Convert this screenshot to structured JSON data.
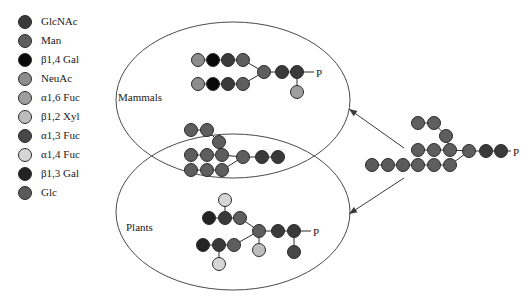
{
  "figure": {
    "phosphate_label": "P",
    "colors": {
      "GlcNAc": "#3a3a3a",
      "Man": "#5e5e5e",
      "b14Gal": "#090909",
      "NeuAc": "#8c8c8c",
      "a16Fuc": "#9e9e9e",
      "b12Xyl": "#bdbdbd",
      "a13Fuc": "#474747",
      "a14Fuc": "#d6d6d6",
      "b13Gal": "#232323",
      "Glc": "#5a5a5a",
      "outline": "#2b2b2b",
      "ellipse": "#4a4a4a",
      "arrow": "#3a3a3a",
      "text": "#1a1a1a"
    }
  },
  "legend": {
    "items": [
      {
        "key": "GlcNAc",
        "label": "GlcNAc",
        "color": "#3a3a3a"
      },
      {
        "key": "Man",
        "label": "Man",
        "color": "#5e5e5e"
      },
      {
        "key": "b14Gal",
        "label": "β1,4 Gal",
        "color": "#090909"
      },
      {
        "key": "NeuAc",
        "label": "NeuAc",
        "color": "#8c8c8c"
      },
      {
        "key": "a16Fuc",
        "label": "α1,6 Fuc",
        "color": "#9e9e9e"
      },
      {
        "key": "b12Xyl",
        "label": "β1,2 Xyl",
        "color": "#bdbdbd"
      },
      {
        "key": "a13Fuc",
        "label": "α1,3 Fuc",
        "color": "#474747"
      },
      {
        "key": "a14Fuc",
        "label": "α1,4 Fuc",
        "color": "#d6d6d6"
      },
      {
        "key": "b13Gal",
        "label": "β1,3 Gal",
        "color": "#232323"
      },
      {
        "key": "Glc",
        "label": "Glc",
        "color": "#5a5a5a"
      }
    ]
  },
  "groups": {
    "mammals": {
      "label": "Mammals",
      "x": 118,
      "y": 92
    },
    "plants": {
      "label": "Plants",
      "x": 126,
      "y": 222
    }
  },
  "ellipses": [
    {
      "name": "mammals-ellipse",
      "cx": 233,
      "cy": 100,
      "rx": 117,
      "ry": 78
    },
    {
      "name": "plants-ellipse",
      "cx": 233,
      "cy": 212,
      "rx": 117,
      "ry": 78
    }
  ],
  "arrows": [
    {
      "name": "arrow-to-mammals",
      "x1": 404,
      "y1": 148,
      "x2": 349,
      "y2": 109
    },
    {
      "name": "arrow-to-plants",
      "x1": 404,
      "y1": 178,
      "x2": 349,
      "y2": 214
    }
  ],
  "structures": [
    {
      "name": "mammals-glycan",
      "nodes": [
        {
          "id": "m-a1",
          "sugar": "NeuAc",
          "x": 198,
          "y": 60
        },
        {
          "id": "m-a2",
          "sugar": "b14Gal",
          "x": 213,
          "y": 60
        },
        {
          "id": "m-a3",
          "sugar": "GlcNAc",
          "x": 228,
          "y": 60
        },
        {
          "id": "m-a4",
          "sugar": "Man",
          "x": 243,
          "y": 60
        },
        {
          "id": "m-b1",
          "sugar": "NeuAc",
          "x": 198,
          "y": 84
        },
        {
          "id": "m-b2",
          "sugar": "b14Gal",
          "x": 213,
          "y": 84
        },
        {
          "id": "m-b3",
          "sugar": "GlcNAc",
          "x": 228,
          "y": 84
        },
        {
          "id": "m-b4",
          "sugar": "Man",
          "x": 243,
          "y": 84
        },
        {
          "id": "m-c1",
          "sugar": "Man",
          "x": 264,
          "y": 72
        },
        {
          "id": "m-c2",
          "sugar": "GlcNAc",
          "x": 282,
          "y": 72
        },
        {
          "id": "m-c3",
          "sugar": "GlcNAc",
          "x": 297,
          "y": 72
        },
        {
          "id": "m-f",
          "sugar": "a16Fuc",
          "x": 297,
          "y": 92
        }
      ],
      "links": [
        [
          "m-a1",
          "m-a2"
        ],
        [
          "m-a2",
          "m-a3"
        ],
        [
          "m-a3",
          "m-a4"
        ],
        [
          "m-a4",
          "m-c1"
        ],
        [
          "m-b1",
          "m-b2"
        ],
        [
          "m-b2",
          "m-b3"
        ],
        [
          "m-b3",
          "m-b4"
        ],
        [
          "m-b4",
          "m-c1"
        ],
        [
          "m-c1",
          "m-c2"
        ],
        [
          "m-c2",
          "m-c3"
        ],
        [
          "m-c3",
          "m-f"
        ]
      ],
      "phosphate": {
        "from": "m-c3",
        "x": 316,
        "y": 68
      }
    },
    {
      "name": "shared-high-mannose-glycan",
      "nodes": [
        {
          "id": "s-t1",
          "sugar": "Man",
          "x": 191,
          "y": 130
        },
        {
          "id": "s-t2",
          "sugar": "Man",
          "x": 207,
          "y": 130
        },
        {
          "id": "s-t3",
          "sugar": "Man",
          "x": 219,
          "y": 142
        },
        {
          "id": "s-m1",
          "sugar": "Man",
          "x": 191,
          "y": 155
        },
        {
          "id": "s-m2",
          "sugar": "Man",
          "x": 207,
          "y": 155
        },
        {
          "id": "s-m3",
          "sugar": "Man",
          "x": 222,
          "y": 155
        },
        {
          "id": "s-l1",
          "sugar": "Man",
          "x": 191,
          "y": 170
        },
        {
          "id": "s-l2",
          "sugar": "Man",
          "x": 207,
          "y": 170
        },
        {
          "id": "s-l3",
          "sugar": "Man",
          "x": 222,
          "y": 170
        },
        {
          "id": "s-c1",
          "sugar": "Man",
          "x": 243,
          "y": 157
        },
        {
          "id": "s-c2",
          "sugar": "GlcNAc",
          "x": 262,
          "y": 157
        },
        {
          "id": "s-c3",
          "sugar": "GlcNAc",
          "x": 278,
          "y": 157
        }
      ],
      "links": [
        [
          "s-t1",
          "s-t2"
        ],
        [
          "s-t2",
          "s-t3"
        ],
        [
          "s-t3",
          "s-m3"
        ],
        [
          "s-m1",
          "s-m2"
        ],
        [
          "s-m2",
          "s-m3"
        ],
        [
          "s-l1",
          "s-l2"
        ],
        [
          "s-l2",
          "s-l3"
        ],
        [
          "s-m3",
          "s-c1"
        ],
        [
          "s-l3",
          "s-c1"
        ],
        [
          "s-c1",
          "s-c2"
        ],
        [
          "s-c2",
          "s-c3"
        ]
      ],
      "phosphate": null
    },
    {
      "name": "plants-glycan",
      "nodes": [
        {
          "id": "p-u0",
          "sugar": "a14Fuc",
          "x": 225,
          "y": 200
        },
        {
          "id": "p-u1",
          "sugar": "b13Gal",
          "x": 209,
          "y": 218
        },
        {
          "id": "p-u2",
          "sugar": "GlcNAc",
          "x": 225,
          "y": 218
        },
        {
          "id": "p-u3",
          "sugar": "Man",
          "x": 240,
          "y": 218
        },
        {
          "id": "p-d1",
          "sugar": "b13Gal",
          "x": 203,
          "y": 245
        },
        {
          "id": "p-d2",
          "sugar": "GlcNAc",
          "x": 219,
          "y": 245
        },
        {
          "id": "p-d3",
          "sugar": "Man",
          "x": 234,
          "y": 245
        },
        {
          "id": "p-d0",
          "sugar": "a14Fuc",
          "x": 219,
          "y": 264
        },
        {
          "id": "p-c1",
          "sugar": "Man",
          "x": 259,
          "y": 231
        },
        {
          "id": "p-x",
          "sugar": "b12Xyl",
          "x": 259,
          "y": 250
        },
        {
          "id": "p-c2",
          "sugar": "GlcNAc",
          "x": 278,
          "y": 231
        },
        {
          "id": "p-c3",
          "sugar": "GlcNAc",
          "x": 294,
          "y": 231
        },
        {
          "id": "p-f",
          "sugar": "a13Fuc",
          "x": 294,
          "y": 252
        }
      ],
      "links": [
        [
          "p-u0",
          "p-u2"
        ],
        [
          "p-u1",
          "p-u2"
        ],
        [
          "p-u2",
          "p-u3"
        ],
        [
          "p-u3",
          "p-c1"
        ],
        [
          "p-d1",
          "p-d2"
        ],
        [
          "p-d2",
          "p-d3"
        ],
        [
          "p-d3",
          "p-c1"
        ],
        [
          "p-d0",
          "p-d2"
        ],
        [
          "p-c1",
          "p-x"
        ],
        [
          "p-c1",
          "p-c2"
        ],
        [
          "p-c2",
          "p-c3"
        ],
        [
          "p-c3",
          "p-f"
        ]
      ],
      "phosphate": {
        "from": "p-c3",
        "x": 313,
        "y": 227
      }
    },
    {
      "name": "precursor-glycan",
      "nodes": [
        {
          "id": "r-t1",
          "sugar": "Man",
          "x": 418,
          "y": 123
        },
        {
          "id": "r-t2",
          "sugar": "Man",
          "x": 434,
          "y": 123
        },
        {
          "id": "r-t3",
          "sugar": "Man",
          "x": 446,
          "y": 136
        },
        {
          "id": "r-m1",
          "sugar": "Man",
          "x": 418,
          "y": 150
        },
        {
          "id": "r-m2",
          "sugar": "Man",
          "x": 434,
          "y": 150
        },
        {
          "id": "r-m3",
          "sugar": "Man",
          "x": 450,
          "y": 150
        },
        {
          "id": "r-b1",
          "sugar": "Glc",
          "x": 372,
          "y": 165
        },
        {
          "id": "r-b2",
          "sugar": "Glc",
          "x": 388,
          "y": 165
        },
        {
          "id": "r-b3",
          "sugar": "Glc",
          "x": 403,
          "y": 165
        },
        {
          "id": "r-b4",
          "sugar": "Man",
          "x": 418,
          "y": 165
        },
        {
          "id": "r-b5",
          "sugar": "Man",
          "x": 434,
          "y": 165
        },
        {
          "id": "r-b6",
          "sugar": "Man",
          "x": 450,
          "y": 165
        },
        {
          "id": "r-c1",
          "sugar": "Man",
          "x": 469,
          "y": 151
        },
        {
          "id": "r-c2",
          "sugar": "GlcNAc",
          "x": 486,
          "y": 151
        },
        {
          "id": "r-c3",
          "sugar": "GlcNAc",
          "x": 501,
          "y": 151
        }
      ],
      "links": [
        [
          "r-t1",
          "r-t2"
        ],
        [
          "r-t2",
          "r-t3"
        ],
        [
          "r-t3",
          "r-m3"
        ],
        [
          "r-m1",
          "r-m2"
        ],
        [
          "r-m2",
          "r-m3"
        ],
        [
          "r-b1",
          "r-b2"
        ],
        [
          "r-b2",
          "r-b3"
        ],
        [
          "r-b3",
          "r-b4"
        ],
        [
          "r-b4",
          "r-b5"
        ],
        [
          "r-b5",
          "r-b6"
        ],
        [
          "r-m3",
          "r-c1"
        ],
        [
          "r-b6",
          "r-c1"
        ],
        [
          "r-c1",
          "r-c2"
        ],
        [
          "r-c2",
          "r-c3"
        ]
      ],
      "phosphate": {
        "from": "r-c3",
        "x": 513,
        "y": 147
      }
    }
  ]
}
